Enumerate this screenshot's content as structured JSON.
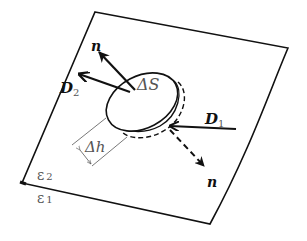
{
  "diagram": {
    "type": "gauss-pillbox-boundary",
    "labels": {
      "n_top": "n",
      "n_bottom": "n",
      "D2": "D",
      "D2_sub": "2",
      "D1": "D",
      "D1_sub": "1",
      "delta_S": "ΔS",
      "delta_h": "Δh",
      "eps2": "ε",
      "eps2_sub": "2",
      "eps1": "ε",
      "eps1_sub": "1"
    },
    "colors": {
      "stroke": "#111111",
      "thin": "#555555",
      "background": "#ffffff"
    }
  }
}
